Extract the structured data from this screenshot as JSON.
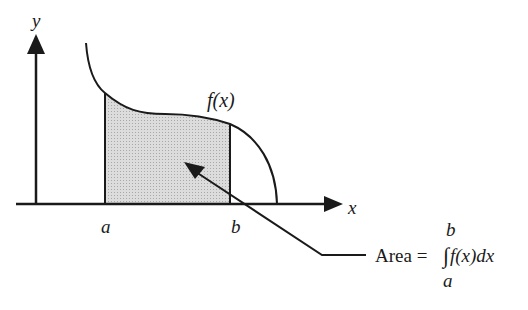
{
  "diagram": {
    "axes": {
      "x_label": "x",
      "y_label": "y"
    },
    "curve": {
      "label": "f(x)"
    },
    "bounds": {
      "lower": "a",
      "upper": "b"
    },
    "annotation": {
      "area_text": "Area =",
      "integral_symbol": "∫",
      "integrand": "f(x)dx",
      "upper_limit": "b",
      "lower_limit": "a"
    },
    "colors": {
      "stroke": "#1a1a1a",
      "shaded_region": "#d4d4d4",
      "background": "#ffffff"
    }
  }
}
